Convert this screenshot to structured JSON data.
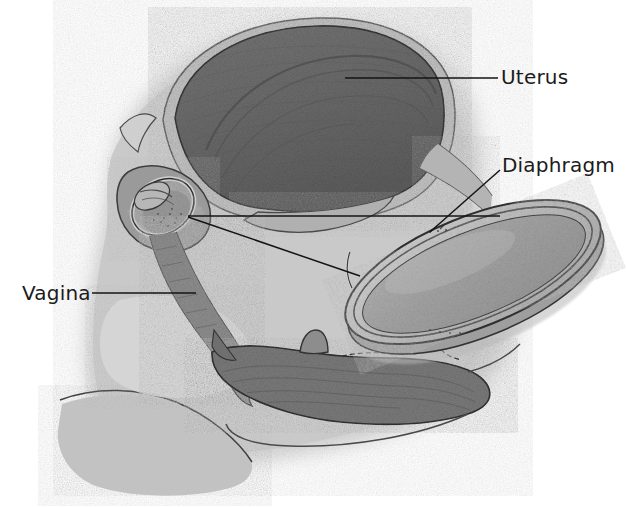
{
  "figure": {
    "kind": "medical-illustration",
    "view": "sagittal cross-section of female pelvis",
    "background_color": "#ffffff",
    "body_tone_color": "#c9c9c9",
    "body_tone_light_color": "#d9d9d9",
    "organ_dark_color": "#6d6d6d",
    "organ_mid_color": "#8a8a8a",
    "serosa_color": "#b9b9b9",
    "outline_color": "#3a3a3a",
    "label_color": "#1b1b1b",
    "leader_color": "#141414"
  },
  "labels": {
    "uterus": "Uterus",
    "diaphragm": "Diaphragm",
    "vagina": "Vagina"
  },
  "structures": [
    {
      "name": "uterus",
      "description": "large dark textured muscular body with light serosa rim, upper left of frame"
    },
    {
      "name": "cervix",
      "description": "small oval structure at lower end of uterus with diaphragm seated over it"
    },
    {
      "name": "diaphragm-in-place",
      "description": "cross-section of contraceptive diaphragm covering the cervix"
    },
    {
      "name": "vagina",
      "description": "canal descending from cervix toward perineum"
    },
    {
      "name": "rectum",
      "description": "dark textured structure along lower right"
    },
    {
      "name": "pelvic-floor",
      "description": "light gray soft tissue at lower left"
    },
    {
      "name": "diaphragm-device",
      "description": "enlarged tilted ellipse device with flexible rim, right of frame"
    }
  ],
  "leaders": [
    {
      "name": "uterus-leader",
      "from": "label Uterus",
      "to": "uterus body",
      "style": "horizontal"
    },
    {
      "name": "diaphragm-leader-device",
      "from": "label Diaphragm",
      "to": "diaphragm device rim",
      "style": "diagonal"
    },
    {
      "name": "cervix-leader-upper",
      "from": "cervix diaphragm",
      "to": "right, horizontal",
      "style": "horizontal"
    },
    {
      "name": "cervix-leader-lower",
      "from": "cervix diaphragm",
      "to": "diaphragm device left rim",
      "style": "diagonal"
    },
    {
      "name": "vagina-leader",
      "from": "label Vagina",
      "to": "vaginal canal wall",
      "style": "horizontal"
    }
  ]
}
